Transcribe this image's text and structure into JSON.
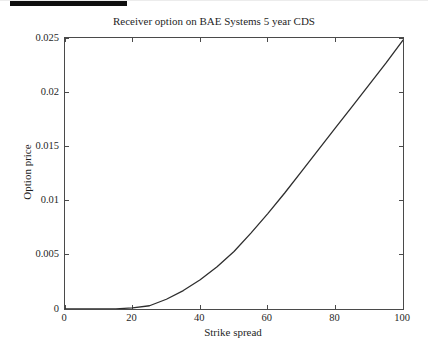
{
  "chart_data": {
    "type": "line",
    "title": "Receiver option on BAE Systems 5 year CDS",
    "xlabel": "Strike spread",
    "ylabel": "Option price",
    "xlim": [
      0,
      100
    ],
    "ylim": [
      0,
      0.025
    ],
    "xticks": [
      0,
      20,
      40,
      60,
      80,
      100
    ],
    "xtick_labels": [
      "0",
      "20",
      "40",
      "60",
      "80",
      "100"
    ],
    "yticks": [
      0,
      0.005,
      0.01,
      0.015,
      0.02,
      0.025
    ],
    "ytick_labels": [
      "0",
      "0.005",
      "0.01",
      "0.015",
      "0.02",
      "0.025"
    ],
    "grid": false,
    "legend": "none",
    "tick_style": "inward, mirrored on all four sides (MATLAB box on)",
    "series": [
      {
        "name": "receiver option price",
        "x": [
          0,
          5,
          10,
          15,
          20,
          25,
          30,
          35,
          40,
          45,
          50,
          55,
          60,
          65,
          70,
          75,
          80,
          85,
          90,
          95,
          100
        ],
        "y": [
          0,
          0,
          0,
          2e-05,
          0.0001,
          0.0003,
          0.0009,
          0.0017,
          0.0027,
          0.0039,
          0.0053,
          0.007,
          0.0088,
          0.0107,
          0.0127,
          0.0147,
          0.0167,
          0.0187,
          0.0207,
          0.0227,
          0.0248
        ]
      }
    ],
    "colors": {
      "background": "#ffffff",
      "axis": "#4a4a4a",
      "curve": "#2e2e2e",
      "text": "#1f1f1f",
      "top_edge_artifact": "#0e0e0e"
    }
  }
}
